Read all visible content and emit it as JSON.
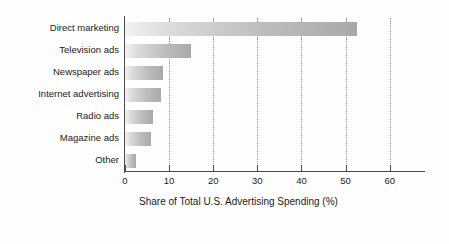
{
  "chart_data": {
    "type": "bar",
    "orientation": "horizontal",
    "title": "",
    "xlabel": "Share of Total U.S. Advertising Spending (%)",
    "ylabel": "",
    "categories": [
      "Direct marketing",
      "Television ads",
      "Newspaper ads",
      "Internet advertising",
      "Radio ads",
      "Magazine ads",
      "Other"
    ],
    "values": [
      52.5,
      15.0,
      8.7,
      8.2,
      6.3,
      5.8,
      2.6
    ],
    "xlim": [
      0,
      68
    ],
    "xticks": [
      0,
      10,
      20,
      30,
      40,
      50,
      60
    ],
    "xtick_labels": [
      "0",
      "10",
      "20",
      "30",
      "40",
      "50",
      "60"
    ],
    "grid": "vertical-dotted",
    "legend": "none",
    "bar_gradient_start": "#f2f2f2",
    "bar_gradient_end": "#a9a9a9",
    "axis_color": "#4a4a4a",
    "gridline_color": "#9a9a9a",
    "background": "#fefefe"
  }
}
